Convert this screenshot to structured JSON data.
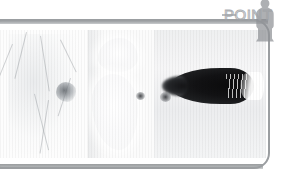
{
  "app": {
    "title": "POINT",
    "watermark_label": "POINT",
    "frame_color": "#9b9ea1",
    "rail_color": "#a6a9ac",
    "background_color": "#ffffff"
  },
  "watermark": {
    "text": "POINT",
    "figure_icon": "person-silhouette-icon",
    "dash_icon": "dash-icon",
    "text_color": "#a0a3a7"
  },
  "viewer": {
    "panel_count": 3,
    "panels": [
      {
        "id": "panel-a",
        "name": "left-image-panel",
        "modality_label": "",
        "description": "faint vascular structures with small dark focus",
        "background_color": "#fdfdfd",
        "marker_color": "#5f646a"
      },
      {
        "id": "panel-b",
        "name": "center-image-panel",
        "overlay_text": "",
        "description": "soft tissue lobes with small dark dot",
        "background_color": "#fbfbfb",
        "marker_color": "#3c3e42"
      },
      {
        "id": "panel-c",
        "name": "right-image-panel",
        "description": "dark elongated projectile shape with bright tail highlight",
        "background_color": "#f6f6f6",
        "object_color": "#0b0b0c",
        "highlight_color": "#ffffff"
      }
    ]
  }
}
